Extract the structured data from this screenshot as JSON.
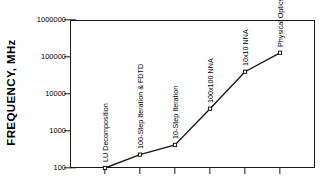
{
  "chart_data": {
    "type": "line",
    "title": "",
    "xlabel": "",
    "ylabel": "FREQUENCY,  MHz",
    "yscale": "log",
    "ylim": [
      100,
      1000000
    ],
    "xlim": [
      0,
      7
    ],
    "grid": false,
    "legend": "none",
    "y_tick_labels": [
      "1000000",
      "100000",
      "10000",
      "1000",
      "100"
    ],
    "y_tick_values": [
      1000000,
      100000,
      10000,
      1000,
      100
    ],
    "x_tick_values": [
      1,
      2,
      3,
      4,
      5,
      6
    ],
    "categories": [
      "LU Decomposition",
      "100-Step Iteration & FDTD",
      "10-Step Iteration",
      "100x100 NNA",
      "10x10 NNA",
      "Physical Optics"
    ],
    "values": [
      100,
      230,
      420,
      4000,
      40000,
      130000
    ],
    "x": [
      1,
      2,
      3,
      4,
      5,
      6
    ],
    "marker": "square",
    "line_color": "#1a1a1a",
    "marker_facecolor": "#ffffff",
    "marker_edgecolor": "#1a1a1a",
    "annotations": [
      {
        "text": "LU Decomposition",
        "value": 100,
        "rotation": -90
      },
      {
        "text": "100-Step Iteration & FDTD",
        "value": 230,
        "rotation": -90
      },
      {
        "text": "10-Step Iteration",
        "value": 420,
        "rotation": -90
      },
      {
        "text": "100x100 NNA",
        "value": 4000,
        "rotation": -90
      },
      {
        "text": "10x10 NNA",
        "value": 40000,
        "rotation": -90
      },
      {
        "text": "Physical Optics",
        "value": 130000,
        "rotation": -90
      }
    ]
  },
  "axis": {
    "y_title": "FREQUENCY,  MHz"
  }
}
